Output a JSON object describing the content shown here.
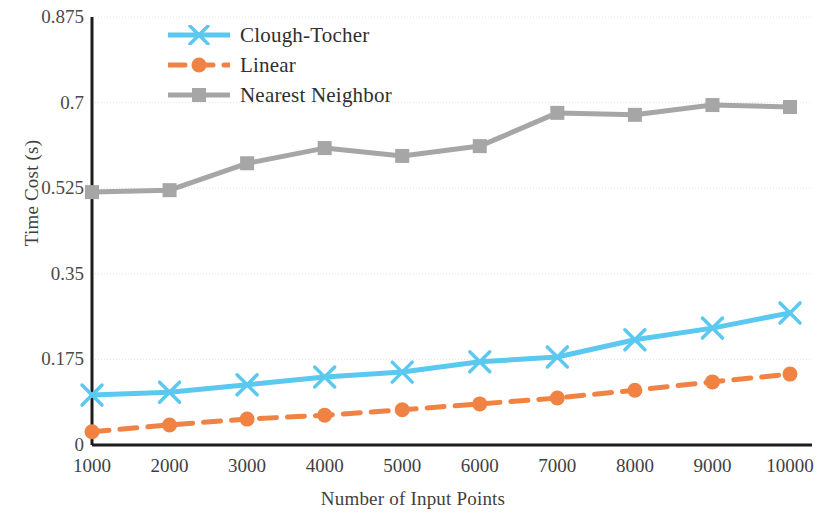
{
  "chart_data": {
    "type": "line",
    "title": "",
    "xlabel": "Number of Input Points",
    "ylabel": "Time Cost (s)",
    "x": [
      1000,
      2000,
      3000,
      4000,
      5000,
      6000,
      7000,
      8000,
      9000,
      10000
    ],
    "xticklabels": [
      "1000",
      "2000",
      "3000",
      "4000",
      "5000",
      "6000",
      "7000",
      "8000",
      "9000",
      "10000"
    ],
    "yticklabels": [
      "0",
      "0.175",
      "0.35",
      "0.525",
      "0.7",
      "0.875"
    ],
    "yticks": [
      0,
      0.175,
      0.35,
      0.525,
      0.7,
      0.875
    ],
    "ylim": [
      0,
      0.875
    ],
    "xlim": [
      1000,
      10000
    ],
    "grid": "horizontal",
    "legend_position": "top-left-inside",
    "series": [
      {
        "name": "Clough-Tocher",
        "color": "#5BC8F0",
        "marker": "x",
        "linestyle": "solid",
        "values": [
          0.102,
          0.108,
          0.123,
          0.139,
          0.149,
          0.17,
          0.18,
          0.215,
          0.239,
          0.27
        ]
      },
      {
        "name": "Linear",
        "color": "#F08344",
        "marker": "circle",
        "linestyle": "dashed",
        "values": [
          0.027,
          0.041,
          0.053,
          0.061,
          0.072,
          0.084,
          0.096,
          0.112,
          0.129,
          0.145
        ]
      },
      {
        "name": "Nearest Neighbor",
        "color": "#A6A6A6",
        "marker": "square",
        "linestyle": "solid",
        "values": [
          0.517,
          0.521,
          0.576,
          0.607,
          0.591,
          0.611,
          0.679,
          0.675,
          0.695,
          0.691
        ]
      }
    ]
  },
  "legend": {
    "items": [
      {
        "label": "Clough-Tocher"
      },
      {
        "label": "Linear"
      },
      {
        "label": "Nearest Neighbor"
      }
    ]
  },
  "axes": {
    "x_title": "Number of Input Points",
    "y_title": "Time Cost (s)"
  }
}
